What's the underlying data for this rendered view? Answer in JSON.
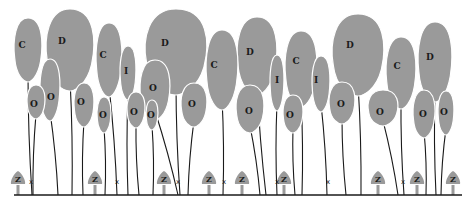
{
  "diagram": {
    "colors": {
      "crown": "#9a9a9a",
      "stem": "#1a1a1a",
      "background": "#ffffff"
    },
    "ground": {
      "y": 195,
      "x1": 14,
      "x2": 462
    },
    "crowns": [
      {
        "label": "C",
        "x": 28,
        "y": 50,
        "rx": 14,
        "ry": 32,
        "stemx": 32,
        "lx": 22,
        "ly": 45
      },
      {
        "label": "D",
        "x": 70,
        "y": 50,
        "rx": 24,
        "ry": 41,
        "stemx": 72,
        "lx": 62,
        "ly": 41
      },
      {
        "label": "O",
        "x": 36,
        "y": 102,
        "rx": 9,
        "ry": 17,
        "stemx": 33,
        "lx": 34,
        "ly": 104
      },
      {
        "label": "O",
        "x": 50,
        "y": 90,
        "rx": 10,
        "ry": 31,
        "stemx": 58,
        "lx": 51,
        "ly": 97
      },
      {
        "label": "O",
        "x": 84,
        "y": 105,
        "rx": 10,
        "ry": 22,
        "stemx": 83,
        "lx": 81,
        "ly": 102
      },
      {
        "label": "C",
        "x": 109,
        "y": 60,
        "rx": 13,
        "ry": 37,
        "stemx": 117,
        "lx": 103,
        "ly": 55
      },
      {
        "label": "I",
        "x": 128,
        "y": 73,
        "rx": 8,
        "ry": 27,
        "stemx": 128,
        "lx": 126,
        "ly": 71
      },
      {
        "label": "O",
        "x": 104,
        "y": 115,
        "rx": 7,
        "ry": 18,
        "stemx": 105,
        "lx": 103,
        "ly": 115
      },
      {
        "label": "O",
        "x": 136,
        "y": 110,
        "rx": 9,
        "ry": 18,
        "stemx": 139,
        "lx": 134,
        "ly": 112
      },
      {
        "label": "O",
        "x": 152,
        "y": 115,
        "rx": 6,
        "ry": 15,
        "stemx": 153,
        "lx": 151,
        "ly": 115
      },
      {
        "label": "D",
        "x": 176,
        "y": 52,
        "rx": 31,
        "ry": 43,
        "stemx": 180,
        "lx": 165,
        "ly": 43
      },
      {
        "label": "O",
        "x": 155,
        "y": 90,
        "rx": 15,
        "ry": 30,
        "stemx": 178,
        "lx": 153,
        "ly": 88
      },
      {
        "label": "O",
        "x": 194,
        "y": 105,
        "rx": 13,
        "ry": 22,
        "stemx": 188,
        "lx": 192,
        "ly": 104
      },
      {
        "label": "C",
        "x": 222,
        "y": 70,
        "rx": 16,
        "ry": 40,
        "stemx": 223,
        "lx": 214,
        "ly": 65
      },
      {
        "label": "D",
        "x": 257,
        "y": 56,
        "rx": 20,
        "ry": 39,
        "stemx": 266,
        "lx": 250,
        "ly": 52
      },
      {
        "label": "O",
        "x": 250,
        "y": 109,
        "rx": 14,
        "ry": 24,
        "stemx": 260,
        "lx": 249,
        "ly": 111
      },
      {
        "label": "I",
        "x": 277,
        "y": 83,
        "rx": 7,
        "ry": 28,
        "stemx": 277,
        "lx": 277,
        "ly": 80
      },
      {
        "label": "C",
        "x": 301,
        "y": 69,
        "rx": 16,
        "ry": 38,
        "stemx": 302,
        "lx": 296,
        "ly": 61
      },
      {
        "label": "O",
        "x": 293,
        "y": 114,
        "rx": 10,
        "ry": 19,
        "stemx": 295,
        "lx": 290,
        "ly": 115
      },
      {
        "label": "I",
        "x": 321,
        "y": 84,
        "rx": 9,
        "ry": 28,
        "stemx": 327,
        "lx": 316,
        "ly": 80
      },
      {
        "label": "O",
        "x": 342,
        "y": 103,
        "rx": 13,
        "ry": 21,
        "stemx": 346,
        "lx": 341,
        "ly": 104
      },
      {
        "label": "D",
        "x": 358,
        "y": 55,
        "rx": 26,
        "ry": 41,
        "stemx": 361,
        "lx": 350,
        "ly": 45
      },
      {
        "label": "C",
        "x": 401,
        "y": 73,
        "rx": 15,
        "ry": 36,
        "stemx": 404,
        "lx": 397,
        "ly": 66
      },
      {
        "label": "O",
        "x": 383,
        "y": 108,
        "rx": 15,
        "ry": 18,
        "stemx": 398,
        "lx": 380,
        "ly": 112
      },
      {
        "label": "D",
        "x": 435,
        "y": 62,
        "rx": 17,
        "ry": 40,
        "stemx": 436,
        "lx": 430,
        "ly": 57
      },
      {
        "label": "O",
        "x": 424,
        "y": 114,
        "rx": 11,
        "ry": 24,
        "stemx": 426,
        "lx": 423,
        "ly": 114
      },
      {
        "label": "O",
        "x": 446,
        "y": 113,
        "rx": 8,
        "ry": 22,
        "stemx": 441,
        "lx": 444,
        "ly": 112
      }
    ],
    "seedlings": [
      {
        "label": "Z",
        "x": 18
      },
      {
        "label": "Z",
        "x": 95
      },
      {
        "label": "Z",
        "x": 164
      },
      {
        "label": "Z",
        "x": 209
      },
      {
        "label": "Z",
        "x": 242
      },
      {
        "label": "Z",
        "x": 284
      },
      {
        "label": "Z",
        "x": 378
      },
      {
        "label": "Z",
        "x": 417
      },
      {
        "label": "Z",
        "x": 453
      }
    ],
    "markers": [
      {
        "label": "x",
        "x": 31
      },
      {
        "label": "x",
        "x": 117
      },
      {
        "label": "x",
        "x": 178
      },
      {
        "label": "x",
        "x": 224
      },
      {
        "label": "x",
        "x": 277
      },
      {
        "label": "x",
        "x": 328
      },
      {
        "label": "x",
        "x": 403
      }
    ]
  }
}
